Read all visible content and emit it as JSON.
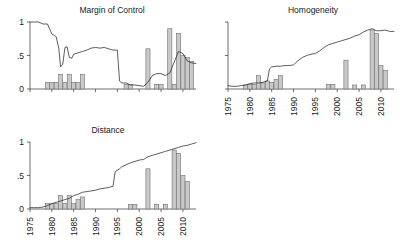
{
  "figure": {
    "background": "#ffffff",
    "line_color": "#333333",
    "bar_fill": "#c9c9c9",
    "bar_stroke": "#707070",
    "axis_color": "#4a4a4a"
  },
  "chart_data": [
    {
      "type": "line",
      "id": "margin-of-control",
      "title": "Margin of Control",
      "xlabel": "",
      "ylabel": "",
      "xlim": [
        1975,
        2013
      ],
      "ylim": [
        0,
        1
      ],
      "grid": false,
      "legend": "none",
      "yticks": [
        0,
        0.5,
        1
      ],
      "ytick_labels": [
        "0",
        ".5",
        "1"
      ],
      "xticks": [
        1975,
        1980,
        1985,
        1990,
        1995,
        2000,
        2005,
        2010
      ],
      "xtick_labels": [
        "",
        "",
        "",
        "",
        "",
        "",
        "",
        ""
      ],
      "xaxis_labels_visible": false,
      "series": [
        {
          "name": "margin of control index",
          "type": "line",
          "x": [
            1975,
            1976,
            1977,
            1978,
            1979,
            1980,
            1980.6,
            1981,
            1981.6,
            1982,
            1982.5,
            1983,
            1983.5,
            1984,
            1984.6,
            1985,
            1986,
            1987,
            1988,
            1989,
            1990,
            1991,
            1992,
            1993,
            1994,
            1995,
            1995.5,
            1996,
            1997,
            1998,
            1999,
            2000,
            2001,
            2002,
            2003,
            2004,
            2005,
            2006,
            2007,
            2008,
            2009,
            2010,
            2011,
            2012,
            2013
          ],
          "y": [
            1.0,
            1.0,
            1.0,
            0.97,
            0.97,
            0.82,
            0.8,
            0.78,
            0.6,
            0.33,
            0.37,
            0.62,
            0.63,
            0.47,
            0.46,
            0.52,
            0.54,
            0.56,
            0.58,
            0.61,
            0.62,
            0.61,
            0.62,
            0.6,
            0.58,
            0.58,
            0.12,
            0.09,
            0.09,
            0.06,
            0.06,
            0.05,
            0.04,
            0.1,
            0.2,
            0.23,
            0.23,
            0.2,
            0.24,
            0.4,
            0.56,
            0.53,
            0.42,
            0.39,
            0.38
          ]
        },
        {
          "name": "bars",
          "type": "bar",
          "bar_width": 0.95,
          "x": [
            1979,
            1980,
            1981,
            1982,
            1983,
            1984,
            1985,
            1986,
            1987,
            1997,
            1998,
            2002,
            2004,
            2005,
            2007,
            2008,
            2009,
            2010,
            2011,
            2012
          ],
          "y": [
            0.1,
            0.1,
            0.1,
            0.22,
            0.1,
            0.22,
            0.1,
            0.1,
            0.22,
            0.07,
            0.07,
            0.6,
            0.07,
            0.07,
            0.9,
            0.07,
            0.83,
            0.5,
            0.47,
            0.41
          ]
        }
      ]
    },
    {
      "type": "line",
      "id": "homogeneity",
      "title": "Homogeneity",
      "xlabel": "",
      "ylabel": "",
      "xlim": [
        1975,
        2013
      ],
      "ylim": [
        0,
        1
      ],
      "grid": false,
      "legend": "none",
      "yticks": [
        0,
        0.5,
        1
      ],
      "ytick_labels": [
        "",
        "",
        ""
      ],
      "xticks": [
        1975,
        1980,
        1985,
        1990,
        1995,
        2000,
        2005,
        2010
      ],
      "xtick_labels": [
        "1975",
        "1980",
        "1985",
        "1990",
        "1995",
        "2000",
        "2005",
        "2010"
      ],
      "xaxis_labels_visible": true,
      "series": [
        {
          "name": "homogeneity index",
          "type": "line",
          "x": [
            1975,
            1976,
            1977,
            1978,
            1979,
            1980,
            1981,
            1982,
            1983,
            1984,
            1984.5,
            1985,
            1986,
            1987,
            1988,
            1989,
            1990,
            1991,
            1992,
            1993,
            1994,
            1995,
            1996,
            1997,
            1998,
            1999,
            2000,
            2001,
            2002,
            2003,
            2004,
            2005,
            2006,
            2007,
            2008,
            2009,
            2010,
            2011,
            2012,
            2013
          ],
          "y": [
            0.05,
            0.04,
            0.04,
            0.05,
            0.06,
            0.08,
            0.09,
            0.09,
            0.1,
            0.12,
            0.3,
            0.33,
            0.34,
            0.34,
            0.35,
            0.35,
            0.36,
            0.42,
            0.47,
            0.5,
            0.52,
            0.53,
            0.57,
            0.62,
            0.66,
            0.68,
            0.7,
            0.72,
            0.74,
            0.76,
            0.79,
            0.81,
            0.85,
            0.88,
            0.9,
            0.87,
            0.87,
            0.88,
            0.86,
            0.86
          ]
        },
        {
          "name": "bars",
          "type": "bar",
          "bar_width": 0.95,
          "x": [
            1979,
            1980,
            1981,
            1982,
            1983,
            1984,
            1985,
            1986,
            1987,
            1998,
            1999,
            2002,
            2004,
            2006,
            2008,
            2009,
            2010,
            2011
          ],
          "y": [
            0.06,
            0.07,
            0.07,
            0.2,
            0.09,
            0.12,
            0.1,
            0.14,
            0.2,
            0.07,
            0.07,
            0.43,
            0.06,
            0.06,
            0.88,
            0.83,
            0.35,
            0.28
          ]
        }
      ]
    },
    {
      "type": "line",
      "id": "distance",
      "title": "Distance",
      "xlabel": "",
      "ylabel": "",
      "xlim": [
        1975,
        2013
      ],
      "ylim": [
        0,
        1
      ],
      "grid": false,
      "legend": "none",
      "yticks": [
        0,
        0.5,
        1
      ],
      "ytick_labels": [
        "0",
        ".5",
        "1"
      ],
      "xticks": [
        1975,
        1980,
        1985,
        1990,
        1995,
        2000,
        2005,
        2010
      ],
      "xtick_labels": [
        "1975",
        "1980",
        "1985",
        "1990",
        "1995",
        "2000",
        "2005",
        "2010"
      ],
      "xaxis_labels_visible": true,
      "series": [
        {
          "name": "distance index",
          "type": "line",
          "x": [
            1975,
            1976,
            1977,
            1978,
            1979,
            1980,
            1981,
            1982,
            1983,
            1984,
            1985,
            1986,
            1987,
            1988,
            1989,
            1990,
            1991,
            1992,
            1993,
            1994,
            1994.5,
            1995,
            1995.5,
            1996,
            1997,
            1998,
            1999,
            2000,
            2001,
            2002,
            2003,
            2004,
            2005,
            2006,
            2007,
            2008,
            2009,
            2010,
            2011,
            2012,
            2013
          ],
          "y": [
            0.02,
            0.02,
            0.02,
            0.03,
            0.05,
            0.08,
            0.1,
            0.12,
            0.14,
            0.16,
            0.2,
            0.22,
            0.25,
            0.26,
            0.27,
            0.28,
            0.3,
            0.31,
            0.32,
            0.34,
            0.56,
            0.58,
            0.6,
            0.63,
            0.66,
            0.69,
            0.71,
            0.73,
            0.74,
            0.78,
            0.8,
            0.82,
            0.84,
            0.86,
            0.88,
            0.9,
            0.92,
            0.94,
            0.95,
            0.97,
            0.99
          ]
        },
        {
          "name": "bars",
          "type": "bar",
          "bar_width": 0.95,
          "x": [
            1979,
            1980,
            1981,
            1982,
            1983,
            1984,
            1985,
            1986,
            1987,
            1998,
            1999,
            2002,
            2004,
            2006,
            2008,
            2009,
            2010,
            2011
          ],
          "y": [
            0.08,
            0.08,
            0.08,
            0.2,
            0.08,
            0.2,
            0.08,
            0.14,
            0.18,
            0.07,
            0.07,
            0.6,
            0.07,
            0.07,
            0.88,
            0.83,
            0.5,
            0.41
          ]
        }
      ]
    }
  ]
}
